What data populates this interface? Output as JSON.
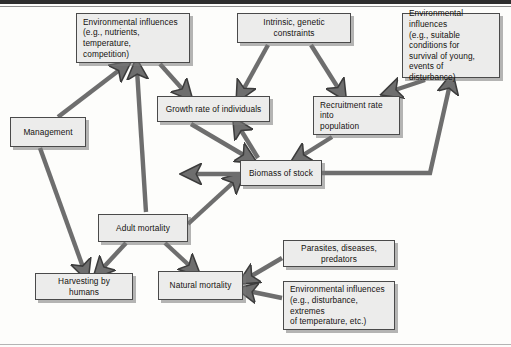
{
  "figure": {
    "type": "flow-diagram",
    "background_color": "#fdfdfb",
    "node_fill_color": "#ececeb",
    "node_border_color": "#4a4a4a",
    "arrow_color": "#6e6e6e",
    "arrow_outline_color": "#3c3c3c"
  },
  "nodes": [
    {
      "id": "env-growth",
      "label": "Environmental influences\n(e.g., nutrients, temperature,\ncompetition)",
      "x": 76,
      "y": 13,
      "w": 114,
      "h": 50,
      "align": "left"
    },
    {
      "id": "intrinsic",
      "label": "Intrinsic, genetic constraints",
      "x": 237,
      "y": 13,
      "w": 114,
      "h": 30,
      "align": "center"
    },
    {
      "id": "env-recruit",
      "label": "Environmental influences\n(e.g., suitable conditions for\nsurvival of young, events of\ndisturbance)",
      "x": 402,
      "y": 13,
      "w": 98,
      "h": 65,
      "align": "left"
    },
    {
      "id": "growth-rate",
      "label": "Growth rate of individuals",
      "x": 157,
      "y": 96,
      "w": 113,
      "h": 26,
      "align": "center"
    },
    {
      "id": "recruitment",
      "label": "Recruitment rate into\npopulation",
      "x": 313,
      "y": 96,
      "w": 87,
      "h": 39,
      "align": "left"
    },
    {
      "id": "management",
      "label": "Management",
      "x": 10,
      "y": 117,
      "w": 76,
      "h": 30,
      "align": "center"
    },
    {
      "id": "biomass",
      "label": "Biomass of stock",
      "x": 240,
      "y": 160,
      "w": 82,
      "h": 26,
      "align": "center"
    },
    {
      "id": "adult-mortality",
      "label": "Adult mortality",
      "x": 98,
      "y": 214,
      "w": 90,
      "h": 28,
      "align": "center"
    },
    {
      "id": "harvesting",
      "label": "Harvesting by humans",
      "x": 35,
      "y": 273,
      "w": 98,
      "h": 27,
      "align": "center"
    },
    {
      "id": "natural-mortality",
      "label": "Natural mortality",
      "x": 158,
      "y": 271,
      "w": 85,
      "h": 29,
      "align": "center"
    },
    {
      "id": "parasites",
      "label": "Parasites, diseases, predators",
      "x": 283,
      "y": 240,
      "w": 112,
      "h": 27,
      "align": "center"
    },
    {
      "id": "env-natural",
      "label": "Environmental influences\n(e.g., disturbance, extremes\nof temperature, etc.)",
      "x": 283,
      "y": 281,
      "w": 112,
      "h": 49,
      "align": "left"
    }
  ],
  "edges": [
    {
      "from": "management",
      "to": "env-growth",
      "label": "management-to-environmental-influences"
    },
    {
      "from": "adult-mortality",
      "to": "env-growth",
      "label": "adult-mortality-to-environmental-influences"
    },
    {
      "from": "env-growth",
      "to": "growth-rate",
      "label": "environmental-influences-to-growth-rate"
    },
    {
      "from": "intrinsic",
      "to": "growth-rate",
      "label": "intrinsic-constraints-to-growth-rate"
    },
    {
      "from": "intrinsic",
      "to": "recruitment",
      "label": "intrinsic-constraints-to-recruitment"
    },
    {
      "from": "env-recruit",
      "to": "recruitment",
      "label": "environmental-influences-to-recruitment"
    },
    {
      "from": "biomass",
      "to": "growth-rate",
      "label": "biomass-to-growth-rate"
    },
    {
      "from": "growth-rate",
      "to": "biomass",
      "label": "growth-rate-to-biomass"
    },
    {
      "from": "recruitment",
      "to": "biomass",
      "label": "recruitment-to-biomass"
    },
    {
      "from": "biomass",
      "to": "env-recruit",
      "label": "biomass-to-environmental-influences-recruit"
    },
    {
      "from": "adult-mortality",
      "to": "biomass",
      "label": "adult-mortality-to-biomass"
    },
    {
      "from": "biomass",
      "to": "adult-mortality",
      "label": "biomass-to-adult-mortality"
    },
    {
      "from": "management",
      "to": "harvesting",
      "label": "management-to-harvesting"
    },
    {
      "from": "adult-mortality",
      "to": "harvesting",
      "label": "adult-mortality-to-harvesting"
    },
    {
      "from": "adult-mortality",
      "to": "natural-mortality",
      "label": "adult-mortality-to-natural-mortality"
    },
    {
      "from": "parasites",
      "to": "natural-mortality",
      "label": "parasites-to-natural-mortality"
    },
    {
      "from": "env-natural",
      "to": "natural-mortality",
      "label": "environmental-influences-to-natural-mortality"
    }
  ]
}
